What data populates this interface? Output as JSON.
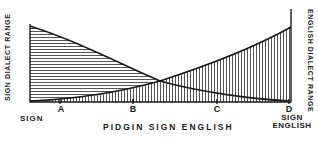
{
  "diagram": {
    "left_axis_label": "SIGN DIALECT RANGE",
    "right_axis_label": "ENGLISH DIALECT RANGE",
    "x_axis_title": "PIDGIN SIGN ENGLISH",
    "left_end_label": "SIGN",
    "right_end_label_line1": "SIGN",
    "right_end_label_line2": "ENGLISH",
    "ticks": [
      {
        "label": "A"
      },
      {
        "label": "B"
      },
      {
        "label": "C"
      },
      {
        "label": "D"
      }
    ],
    "curves": [
      {
        "name": "Sign dialect range",
        "hatch": "horizontal",
        "trend": "decreasing from left to right"
      },
      {
        "name": "English dialect range",
        "hatch": "vertical",
        "trend": "increasing from left to right"
      }
    ],
    "colors": {
      "ink": "#1a1a1a",
      "background": "#ffffff"
    }
  }
}
